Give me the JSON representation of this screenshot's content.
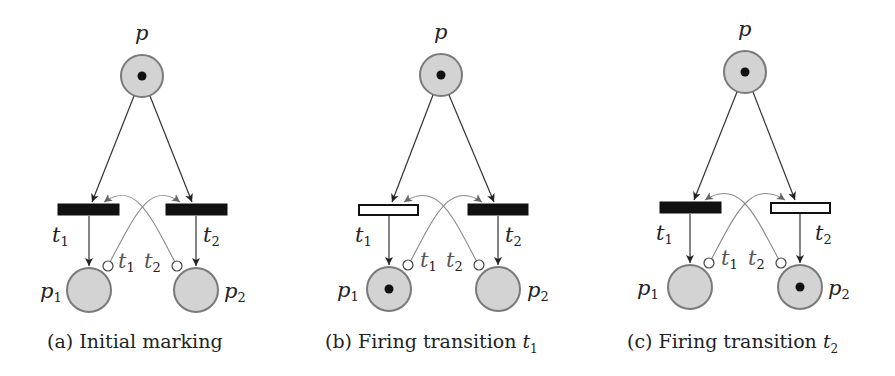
{
  "figure": {
    "panels": [
      {
        "id": "a",
        "caption_prefix": "(a) Initial marking",
        "caption_math": "",
        "caption_sub": "",
        "places": {
          "p": {
            "label": "p",
            "tokens": 1
          },
          "p1": {
            "label": "p",
            "sub": "1",
            "tokens": 0
          },
          "p2": {
            "label": "p",
            "sub": "2",
            "tokens": 0
          }
        },
        "transitions": {
          "t1": {
            "label": "t",
            "sub": "1",
            "state": "filled"
          },
          "t2": {
            "label": "t",
            "sub": "2",
            "state": "filled"
          }
        },
        "inhibitor_labels": [
          {
            "label": "t",
            "sub": "1"
          },
          {
            "label": "t",
            "sub": "2"
          }
        ]
      },
      {
        "id": "b",
        "caption_prefix": "(b) Firing transition ",
        "caption_math": "t",
        "caption_sub": "1",
        "places": {
          "p": {
            "label": "p",
            "tokens": 1
          },
          "p1": {
            "label": "p",
            "sub": "1",
            "tokens": 1
          },
          "p2": {
            "label": "p",
            "sub": "2",
            "tokens": 0
          }
        },
        "transitions": {
          "t1": {
            "label": "t",
            "sub": "1",
            "state": "empty"
          },
          "t2": {
            "label": "t",
            "sub": "2",
            "state": "filled"
          }
        },
        "inhibitor_labels": [
          {
            "label": "t",
            "sub": "1"
          },
          {
            "label": "t",
            "sub": "2"
          }
        ]
      },
      {
        "id": "c",
        "caption_prefix": "(c) Firing transition ",
        "caption_math": "t",
        "caption_sub": "2",
        "places": {
          "p": {
            "label": "p",
            "tokens": 1
          },
          "p1": {
            "label": "p",
            "sub": "1",
            "tokens": 0
          },
          "p2": {
            "label": "p",
            "sub": "2",
            "tokens": 1
          }
        },
        "transitions": {
          "t1": {
            "label": "t",
            "sub": "1",
            "state": "filled"
          },
          "t2": {
            "label": "t",
            "sub": "2",
            "state": "empty"
          }
        },
        "inhibitor_labels": [
          {
            "label": "t",
            "sub": "1"
          },
          {
            "label": "t",
            "sub": "2"
          }
        ]
      }
    ],
    "colors": {
      "place_fill": "#d3d3d3",
      "place_stroke": "#7a7a7a",
      "token": "#111111",
      "transition_filled": "#111111",
      "inhibitor_arc": "#8a8a8a"
    }
  }
}
